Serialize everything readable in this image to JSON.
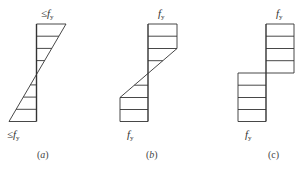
{
  "figure": {
    "line_color": "#333333",
    "panels": [
      {
        "id": "a",
        "caption": "a",
        "description": "Linear (triangular) stress distribution, elastic, extreme fibres at most yield stress",
        "top_label": {
          "prefix": "≤",
          "symbol": "f",
          "subscript": "y"
        },
        "bottom_label": {
          "prefix": "≤",
          "symbol": "f",
          "subscript": "y"
        }
      },
      {
        "id": "b",
        "caption": "b",
        "description": "Elastic-plastic stress distribution, outer zones yielded at fy, linear core",
        "top_label": {
          "prefix": "",
          "symbol": "f",
          "subscript": "y"
        },
        "bottom_label": {
          "prefix": "",
          "symbol": "f",
          "subscript": "y"
        }
      },
      {
        "id": "c",
        "caption": "c",
        "description": "Fully plastic stress distribution, rectangular blocks at fy",
        "top_label": {
          "prefix": "",
          "symbol": "f",
          "subscript": "y"
        },
        "bottom_label": {
          "prefix": "",
          "symbol": "f",
          "subscript": "y"
        }
      }
    ]
  }
}
